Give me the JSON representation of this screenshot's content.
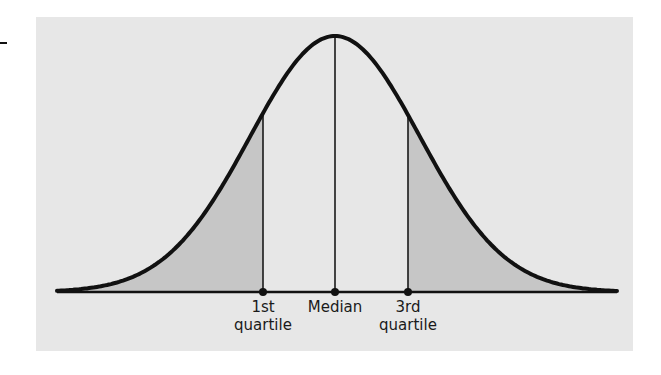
{
  "figure": {
    "title": "",
    "labels": {
      "q1_line1": "1st",
      "q1_line2": "quartile",
      "median": "Median",
      "q3_line1": "3rd",
      "q3_line2": "quartile"
    },
    "colors": {
      "panel": "#e7e7e7",
      "shade": "#c6c6c6",
      "curve": "#111111",
      "line": "#1a1a1a"
    },
    "geometry": {
      "baseline_y": 292,
      "x_start": 57,
      "x_end": 617,
      "center_x": 335,
      "peak_y": 36,
      "sigma_px": 85,
      "q1_x": 263,
      "median_x": 335,
      "q3_x": 408
    }
  }
}
